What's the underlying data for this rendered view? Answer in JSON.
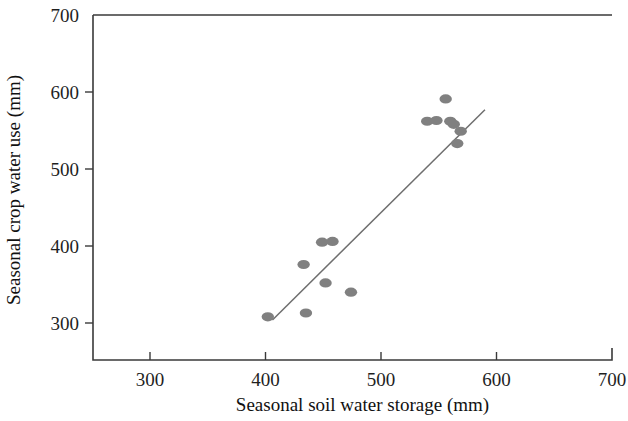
{
  "chart_data": {
    "type": "scatter",
    "title": "",
    "xlabel": "Seasonal soil water storage (mm)",
    "ylabel": "Seasonal crop water use (mm)",
    "xlim": [
      250,
      700
    ],
    "ylim": [
      270,
      700
    ],
    "xticks": [
      300,
      400,
      500,
      600,
      700
    ],
    "yticks": [
      300,
      400,
      500,
      600,
      700
    ],
    "xtick_labels": [
      "300",
      "400",
      "500",
      "600",
      "700"
    ],
    "ytick_labels": [
      "300",
      "400",
      "500",
      "600",
      "700"
    ],
    "grid": false,
    "legend": false,
    "marker_color": "#808080",
    "marker_shape": "ellipse",
    "points": [
      {
        "x": 402,
        "y": 308
      },
      {
        "x": 435,
        "y": 313
      },
      {
        "x": 449,
        "y": 405
      },
      {
        "x": 458,
        "y": 406
      },
      {
        "x": 433,
        "y": 376
      },
      {
        "x": 452,
        "y": 352
      },
      {
        "x": 474,
        "y": 340
      },
      {
        "x": 540,
        "y": 562
      },
      {
        "x": 548,
        "y": 563
      },
      {
        "x": 560,
        "y": 562
      },
      {
        "x": 563,
        "y": 558
      },
      {
        "x": 556,
        "y": 591
      },
      {
        "x": 569,
        "y": 549
      },
      {
        "x": 566,
        "y": 533
      }
    ],
    "trendline": {
      "type": "linear-fit",
      "x_start": 406,
      "y_start": 304,
      "x_end": 590,
      "y_end": 577
    }
  },
  "axes": {
    "x_axis_name": "x-axis",
    "y_axis_name": "y-axis"
  }
}
